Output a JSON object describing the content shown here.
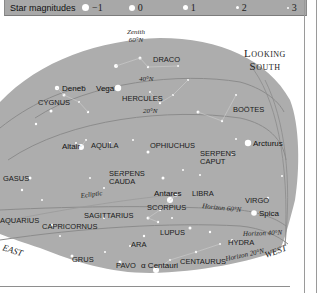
{
  "legend": {
    "title": "Star magnitudes",
    "items": [
      {
        "label": "−1",
        "size": 9
      },
      {
        "label": "0",
        "size": 7
      },
      {
        "label": "1",
        "size": 5
      },
      {
        "label": "2",
        "size": 4
      },
      {
        "label": "3",
        "size": 2
      }
    ]
  },
  "chart": {
    "heading_line1": "Looking",
    "heading_line2": "South",
    "zenith_line1": "Zenith",
    "zenith_line2": "60°N",
    "lat40": "40°N",
    "lat20": "20°N",
    "ecliptic": "Ecliptic",
    "horizon60": "Horizon 60°N",
    "horizon40": "Horizon 40°N",
    "horizon20": "Horizon 20°N",
    "east": "EAST",
    "west": "WEST",
    "constellations": {
      "draco": "DRACO",
      "cygnus": "CYGNUS",
      "hercules": "HERCULES",
      "bootes": "BOÖTES",
      "aquila": "AQUILA",
      "ophiuchus": "OPHIUCHUS",
      "serpens_caput_1": "SERPENS",
      "serpens_caput_2": "CAPUT",
      "serpens_cauda_1": "SERPENS",
      "serpens_cauda_2": "CAUDA",
      "pegasus": "GASUS",
      "libra": "LIBRA",
      "virgo": "VIRGO",
      "scorpius": "SCORPIUS",
      "sagittarius": "SAGITTARIUS",
      "aquarius": "AQUARIUS",
      "capricornus": "CAPRICORNUS",
      "lupus": "LUPUS",
      "hydra": "HYDRA",
      "ara": "ARA",
      "grus": "GRUS",
      "pavo": "PAVO",
      "centaurus": "CENTAURUS"
    },
    "stars": {
      "deneb": "Deneb",
      "vega": "Vega",
      "arcturus": "Arcturus",
      "altair": "Altair",
      "antares": "Antares",
      "spica": "Spica",
      "alpha_centauri": "α Centauri"
    }
  }
}
